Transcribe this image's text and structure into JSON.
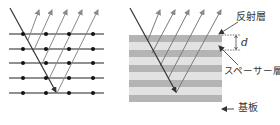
{
  "figure": {
    "left_panel": {
      "description": "crystal lattice Bragg reflection",
      "lattice_rows_y": [
        34,
        49,
        63,
        78,
        93
      ],
      "atom_columns_x": [
        23,
        46,
        69,
        93
      ],
      "row_x_range": [
        9,
        104
      ]
    },
    "right_panel": {
      "description": "multilayer mirror",
      "dark_bands_y": [
        35,
        50,
        65,
        80,
        95
      ],
      "band_height": 7,
      "stack_x_range": [
        129,
        222
      ]
    },
    "labels": {
      "reflective_layer": "反射層",
      "spacing": "d",
      "spacer_layer": "スペーサー層",
      "substrate": "基板"
    },
    "colors": {
      "dark_band": "#b4b4b4",
      "light_band": "#e2e2e2",
      "incident_ray": "#333333",
      "reflected_ray": "#8a8a8a",
      "lattice": "#222222"
    }
  }
}
